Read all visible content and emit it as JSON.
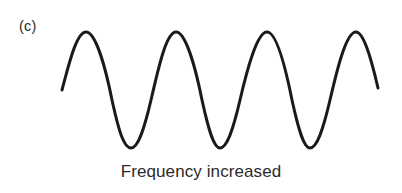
{
  "figure": {
    "panel_label": "(c)",
    "caption": "Frequency increased",
    "background_color": "#ffffff",
    "stroke_color": "#1a1a1a",
    "text_color": "#2b2b2b",
    "stroke_width": 3
  },
  "chart_data": {
    "type": "line",
    "title": "Frequency increased",
    "subtitle": "",
    "xlabel": "",
    "ylabel": "",
    "grid": false,
    "legend": null,
    "axes_visible": false,
    "tick_labels_x": [],
    "tick_labels_y": [],
    "waveform": {
      "shape": "sine",
      "cycles": 3.6,
      "period_px": 90,
      "amplitude_px": 58,
      "midline_y_px": 90,
      "peak_y_px": 32,
      "trough_y_px": 148,
      "start_point": [
        62,
        90
      ],
      "end_point": [
        378,
        88
      ],
      "peaks_x_px": [
        86,
        176,
        267,
        356
      ],
      "troughs_x_px": [
        131,
        220,
        310
      ],
      "zero_crossings_x_px": [
        62,
        108,
        153,
        198,
        244,
        289,
        334,
        378
      ]
    },
    "path_d": "M 62 90 C 68 68, 76 32, 86 32 C 96 32, 106 70, 112 100 C 119 132, 124 148, 131 148 C 138 148, 144 130, 151 100 C 158 70, 166 32, 176 32 C 186 32, 196 70, 202 100 C 209 132, 214 148, 220 148 C 227 148, 233 130, 240 100 C 247 70, 257 32, 267 32 C 277 32, 286 70, 292 100 C 299 132, 304 148, 310 148 C 317 148, 323 130, 330 100 C 337 70, 346 32, 356 32 C 364 32, 372 62, 378 88"
  }
}
